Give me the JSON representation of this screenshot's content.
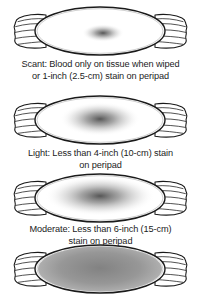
{
  "figure": {
    "items": [
      {
        "level": "scant",
        "caption_line1": "Scant: Blood only on tissue when wiped",
        "caption_line2": "or 1-inch (2.5-cm) stain on peripad",
        "stain": {
          "cx": "103",
          "cy": "30",
          "rx": "21",
          "ry": "9"
        }
      },
      {
        "level": "light",
        "caption_line1": "Light: Less than 4-inch (10-cm) stain",
        "caption_line2": "on peripad",
        "stain": {
          "cx": "100",
          "cy": "27",
          "rx": "40",
          "ry": "17"
        }
      },
      {
        "level": "moderate",
        "caption_line1": "Moderate: Less than 6-inch (15-cm)",
        "caption_line2": "stain on peripad",
        "stain": {
          "cx": "100",
          "cy": "26",
          "rx": "55",
          "ry": "20"
        }
      },
      {
        "level": "heavy",
        "stain": {
          "cx": "100",
          "cy": "28",
          "rx": "66",
          "ry": "26"
        }
      }
    ],
    "colors": {
      "ink": "#1a1a1a",
      "stain_center": "#474747",
      "heavy_fill": "#979797",
      "background": "#ffffff"
    }
  }
}
